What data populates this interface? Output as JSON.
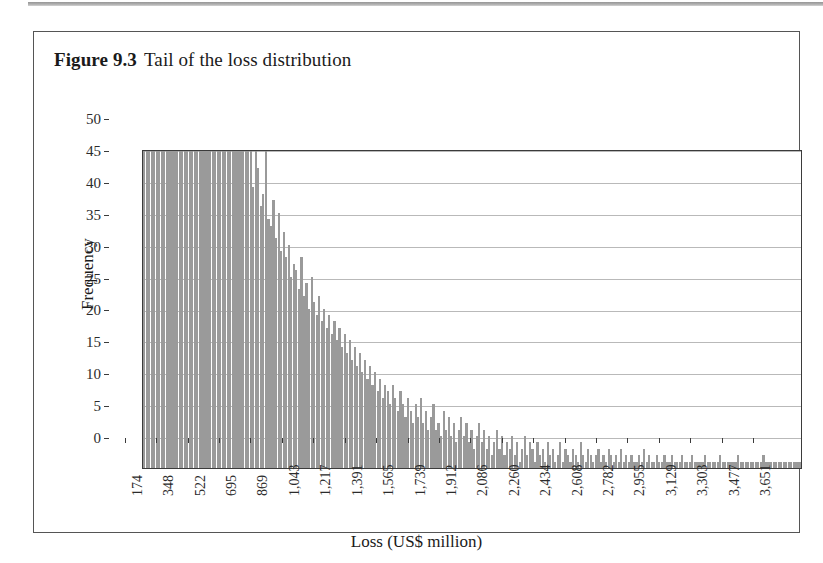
{
  "figure": {
    "label": "Figure 9.3",
    "title": "Tail of the loss distribution"
  },
  "colors": {
    "bar_fill": "#9a9a9a",
    "gridline": "#b9b9b9",
    "axis": "#3b3b3b",
    "frame": "#555555",
    "text": "#1a1a1a"
  },
  "chart_data": {
    "type": "bar",
    "title": "Tail of the loss distribution",
    "xlabel": "Loss (US$ million)",
    "ylabel": "Frequency",
    "ylim": [
      0,
      50
    ],
    "yticks": [
      0,
      5,
      10,
      15,
      20,
      25,
      30,
      35,
      40,
      45,
      50
    ],
    "xlim": [
      87,
      3738
    ],
    "grid": true,
    "legend": false,
    "note": "Histogram of simulated losses; leftmost bins are clipped at the axis maximum of 50.",
    "bin_width": 13.9,
    "xtick_labels": [
      "174",
      "348",
      "522",
      "695",
      "869",
      "1,043",
      "1,217",
      "1,391",
      "1,565",
      "1,739",
      "1,912",
      "2,086",
      "2,260",
      "2,434",
      "2,608",
      "2,782",
      "2,955",
      "3,129",
      "3,303",
      "3,477",
      "3,651"
    ],
    "xtick_values": [
      174,
      348,
      522,
      695,
      869,
      1043,
      1217,
      1391,
      1565,
      1739,
      1912,
      2086,
      2260,
      2434,
      2608,
      2782,
      2955,
      3129,
      3303,
      3477,
      3651
    ],
    "values": [
      50,
      50,
      50,
      50,
      50,
      50,
      50,
      50,
      50,
      50,
      50,
      50,
      50,
      50,
      50,
      50,
      50,
      50,
      50,
      50,
      50,
      50,
      50,
      50,
      50,
      50,
      50,
      50,
      50,
      50,
      50,
      50,
      50,
      50,
      50,
      50,
      50,
      50,
      50,
      50,
      50,
      50,
      50,
      44,
      50,
      47,
      41,
      43,
      50,
      39,
      38,
      42,
      36,
      40,
      34,
      37,
      33,
      35,
      30,
      32,
      31,
      28,
      33,
      27,
      29,
      25,
      30,
      26,
      24,
      27,
      23,
      25,
      22,
      24,
      21,
      23,
      20,
      22,
      19,
      21,
      18,
      20,
      17,
      19,
      16,
      18,
      15,
      17,
      14,
      16,
      13,
      15,
      12,
      14,
      11,
      13,
      12,
      10,
      13,
      11,
      9,
      12,
      10,
      8,
      11,
      9,
      7,
      10,
      8,
      11,
      7,
      9,
      6,
      8,
      10,
      6,
      7,
      5,
      9,
      6,
      8,
      5,
      7,
      4,
      6,
      8,
      5,
      7,
      4,
      6,
      3,
      5,
      7,
      4,
      6,
      3,
      5,
      2,
      4,
      6,
      3,
      5,
      2,
      4,
      3,
      5,
      2,
      4,
      1,
      3,
      5,
      2,
      4,
      3,
      1,
      4,
      2,
      3,
      1,
      4,
      2,
      3,
      1,
      2,
      4,
      1,
      3,
      2,
      1,
      3,
      2,
      1,
      4,
      2,
      1,
      3,
      2,
      1,
      2,
      3,
      1,
      2,
      1,
      3,
      2,
      1,
      2,
      1,
      3,
      1,
      2,
      1,
      2,
      1,
      1,
      2,
      1,
      3,
      1,
      2,
      1,
      1,
      2,
      1,
      1,
      2,
      1,
      1,
      2,
      1,
      1,
      1,
      2,
      1,
      1,
      1,
      2,
      1,
      1,
      1,
      1,
      2,
      1,
      1,
      1,
      1,
      1,
      2,
      1,
      1,
      1,
      1,
      1,
      1,
      2,
      1,
      1,
      1,
      1,
      1,
      1,
      1,
      1,
      1,
      2,
      1,
      1,
      1,
      1,
      1,
      1,
      1,
      1,
      1,
      1,
      1,
      1,
      1,
      1,
      1
    ]
  }
}
